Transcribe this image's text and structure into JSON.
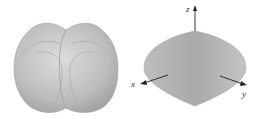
{
  "figures": [
    {
      "id": "left",
      "description": "Gray shaded 3D solid formed by intersecting/union of rounded surfaces, shown without axes"
    },
    {
      "id": "right",
      "description": "Gray shaded lens-shaped 3D solid with coordinate axes",
      "axes": {
        "z": "z",
        "x": "x",
        "y": "y"
      }
    }
  ],
  "colors": {
    "surface_light": "#d6d6d6",
    "surface_mid": "#b5b5b5",
    "surface_dark": "#9a9a9a",
    "axis": "#333333"
  }
}
